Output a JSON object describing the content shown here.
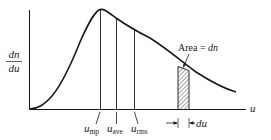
{
  "figure": {
    "type": "speed-distribution",
    "y_axis_label_numerator": "dn",
    "y_axis_label_denominator": "du",
    "x_axis_label": "u",
    "area_label_prefix": "Area = ",
    "area_label_var": "dn",
    "strip_width_label": "du",
    "markers": [
      {
        "base": "u",
        "sub": "mp"
      },
      {
        "base": "u",
        "sub": "ave"
      },
      {
        "base": "u",
        "sub": "rms"
      }
    ],
    "colors": {
      "stroke": "#1a1a1a",
      "background": "#ffffff"
    }
  }
}
